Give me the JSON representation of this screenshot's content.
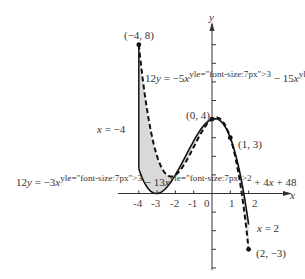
{
  "figure": {
    "axes": {
      "x_label": "x",
      "y_label": "y",
      "x_ticks": [
        "-4",
        "-3",
        "-2",
        "-1",
        "0",
        "1",
        "2"
      ]
    },
    "curves": [
      {
        "name": "upper",
        "equation": "12y = −5x³ − 15x² + 8x + 48",
        "style": "dashed"
      },
      {
        "name": "lower",
        "equation": "12y = −3x³ − 13x² + 4x + 48",
        "style": "solid"
      }
    ],
    "lines": [
      {
        "label": "x = −4"
      },
      {
        "label": "x = 2"
      }
    ],
    "points": [
      {
        "label": "(−4, 8)"
      },
      {
        "label": "(0, 4)"
      },
      {
        "label": "(1, 3)"
      },
      {
        "label": "(2, −3)"
      }
    ],
    "shading_color": "#d9d9d9"
  },
  "chart_data": {
    "type": "line",
    "title": "",
    "xlabel": "x",
    "ylabel": "y",
    "xlim": [
      -4.6,
      3.5
    ],
    "ylim": [
      -4,
      10
    ],
    "series": [
      {
        "name": "12y = -5x^3 - 15x^2 + 8x + 48",
        "x": [
          -4,
          -3,
          -2,
          -1,
          0,
          1,
          2
        ],
        "values": [
          8,
          2,
          1,
          2.5,
          4,
          3,
          -3
        ]
      },
      {
        "name": "12y = -3x^3 - 13x^2 + 4x + 48",
        "x": [
          -4,
          -3,
          -2,
          -1,
          0,
          1,
          2
        ],
        "values": [
          2.667,
          0,
          1,
          3,
          4,
          3,
          -1.667
        ]
      }
    ],
    "annotations": [
      "(-4, 8)",
      "(0, 4)",
      "(1, 3)",
      "(2, -3)",
      "x = -4",
      "x = 2"
    ],
    "shaded_region": "between curves from x = -4 to x = 2"
  }
}
